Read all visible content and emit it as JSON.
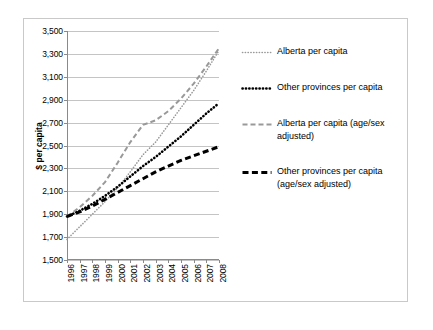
{
  "chart_data": {
    "type": "line",
    "title": "",
    "xlabel": "",
    "ylabel": "$ per capita",
    "ylim": [
      1500,
      3500
    ],
    "ytick_step": 200,
    "grid": true,
    "legend_position": "right",
    "x": [
      1996,
      1997,
      1998,
      1999,
      2000,
      2001,
      2002,
      2003,
      2004,
      2005,
      2006,
      2007,
      2008
    ],
    "categories": [
      "1996",
      "1997",
      "1998",
      "1999",
      "2000",
      "2001",
      "2002",
      "2003",
      "2004",
      "2005",
      "2006",
      "2007",
      "2008"
    ],
    "yticks": [
      "1,500",
      "1,700",
      "1,900",
      "2,100",
      "2,300",
      "2,500",
      "2,700",
      "2,900",
      "3,100",
      "3,300",
      "3,500"
    ],
    "series": [
      {
        "name": "Alberta per capita",
        "style": "fine-dotted",
        "color": "#999999",
        "values": [
          1680,
          1790,
          1900,
          2010,
          2130,
          2270,
          2420,
          2530,
          2680,
          2830,
          2980,
          3150,
          3330
        ]
      },
      {
        "name": "Other provinces per capita",
        "style": "bold-dotted",
        "color": "#000000",
        "values": [
          1880,
          1930,
          1990,
          2060,
          2140,
          2230,
          2320,
          2400,
          2490,
          2580,
          2680,
          2780,
          2870
        ]
      },
      {
        "name": "Alberta per capita (age/sex adjusted)",
        "style": "dashed",
        "color": "#999999",
        "values": [
          1880,
          1960,
          2060,
          2180,
          2350,
          2530,
          2680,
          2720,
          2800,
          2910,
          3040,
          3190,
          3350
        ]
      },
      {
        "name": "Other provinces per capita (age/sex adjusted)",
        "style": "bold-dashed",
        "color": "#000000",
        "values": [
          1880,
          1920,
          1970,
          2030,
          2090,
          2150,
          2210,
          2270,
          2320,
          2370,
          2410,
          2450,
          2490
        ]
      }
    ]
  },
  "legend": {
    "entries": [
      {
        "label": "Alberta per capita",
        "swatch": "fine-dotted-gray-swatch"
      },
      {
        "label": "Other provinces per capita",
        "swatch": "bold-dotted-black-swatch"
      },
      {
        "label": "Alberta per capita (age/sex adjusted)",
        "swatch": "dashed-gray-swatch"
      },
      {
        "label": "Other provinces per capita (age/sex adjusted)",
        "swatch": "bold-dashed-black-swatch"
      }
    ]
  }
}
